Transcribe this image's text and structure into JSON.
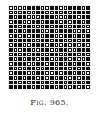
{
  "figure": {
    "caption": "Fig. 965.",
    "grid_size": [
      18,
      18
    ],
    "legend": {
      "1": "filled-square",
      "0": "open-square"
    },
    "rows": [
      "000011100110011101",
      "000100110010101111",
      "101100011100011011",
      "011001101110101101",
      "110110001011001100",
      "101011100101110010",
      "010101101100110101",
      "101110011011001011",
      "011001110100101010",
      "100110011001100111",
      "010101100110011010",
      "101011011001101001",
      "011100110101010110",
      "100011001101101011",
      "011100110010110100",
      "101011010101001011",
      "110101101011010101",
      "111110101101001010"
    ]
  }
}
